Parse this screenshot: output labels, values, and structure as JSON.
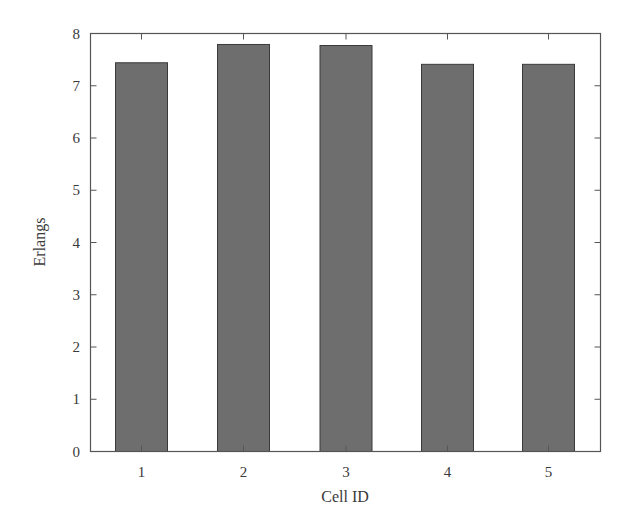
{
  "chart_data": {
    "type": "bar",
    "title": "",
    "xlabel": "Cell ID",
    "ylabel": "Erlangs",
    "categories": [
      "1",
      "2",
      "3",
      "4",
      "5"
    ],
    "values": [
      7.44,
      7.79,
      7.77,
      7.41,
      7.41
    ],
    "ylim": [
      0,
      8
    ],
    "yticks": [
      0,
      1,
      2,
      3,
      4,
      5,
      6,
      7,
      8
    ],
    "grid": false,
    "legend": null,
    "bar_color": "#6e6e6e",
    "bar_edge_color": "#3a3a3a",
    "frame_color": "#555555"
  }
}
